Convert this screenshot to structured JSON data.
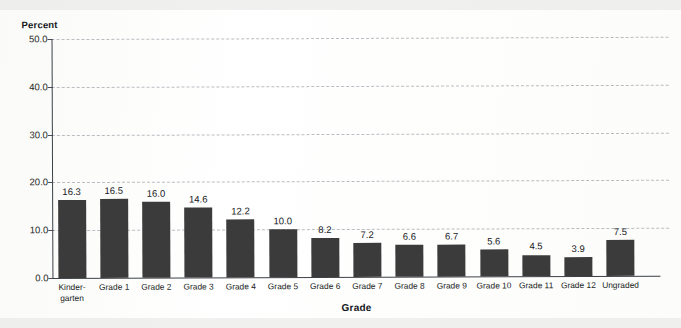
{
  "chart_data": {
    "type": "bar",
    "title": "",
    "xlabel": "Grade",
    "ylabel": "Percent",
    "ylim": [
      0.0,
      50.0
    ],
    "ytick_labels": [
      "0.0",
      "10.0",
      "20.0",
      "30.0",
      "40.0",
      "50.0"
    ],
    "ytick_values": [
      0.0,
      10.0,
      20.0,
      30.0,
      40.0,
      50.0
    ],
    "grid": "horizontal-dashed",
    "legend": "none",
    "bar_color": "#3b3b3c",
    "categories": [
      "Kinder-\ngarten",
      "Grade 1",
      "Grade 2",
      "Grade 3",
      "Grade 4",
      "Grade 5",
      "Grade 6",
      "Grade 7",
      "Grade 8",
      "Grade 9",
      "Grade 10",
      "Grade 11",
      "Grade 12",
      "Ungraded"
    ],
    "values": [
      16.3,
      16.5,
      16.0,
      14.6,
      12.2,
      10.0,
      8.2,
      7.2,
      6.6,
      6.7,
      5.6,
      4.5,
      3.9,
      7.5
    ],
    "value_labels": [
      "16.3",
      "16.5",
      "16.0",
      "14.6",
      "12.2",
      "10.0",
      "8.2",
      "7.2",
      "6.6",
      "6.7",
      "5.6",
      "4.5",
      "3.9",
      "7.5"
    ]
  }
}
